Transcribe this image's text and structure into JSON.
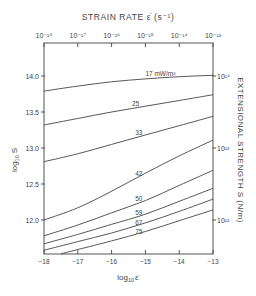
{
  "chart_data": {
    "type": "line",
    "title": "STRAIN RATE ε̇ (s⁻¹)",
    "xlabel": "log10 ε̇",
    "ylabel": "log10 S",
    "right_ylabel": "EXTENSIONAL STRENGTH S (N/m)",
    "top_xlabel": "STRAIN RATE ε̇ (s⁻¹)",
    "xlim": [
      -18,
      -13
    ],
    "ylim": [
      11.53,
      14.46
    ],
    "x_ticks": [
      -18,
      -17,
      -16,
      -15,
      -14,
      -13
    ],
    "x_tick_labels": [
      "−18",
      "−17",
      "−16",
      "−15",
      "−14",
      "−13"
    ],
    "top_x_tick_labels": [
      "10⁻¹⁸",
      "10⁻¹⁷",
      "10⁻¹⁶",
      "10⁻¹⁵",
      "10⁻¹⁴",
      "10⁻¹³"
    ],
    "y_ticks": [
      12.0,
      12.5,
      13.0,
      13.5,
      14.0
    ],
    "y_tick_labels": [
      "12.0",
      "12.5",
      "13.0",
      "13.5",
      "14.0"
    ],
    "right_y_ticks": [
      12,
      13,
      14
    ],
    "right_y_tick_labels": [
      "10¹²",
      "10¹³",
      "10¹⁴"
    ],
    "grid": false,
    "legend": "inline curve labels (heat flow)",
    "series": [
      {
        "name": "17 mW/m²",
        "label": "17 mW/m²",
        "x": [
          -18,
          -17,
          -16,
          -15,
          -14,
          -13
        ],
        "values": [
          13.79,
          13.86,
          13.92,
          13.96,
          13.99,
          14.01
        ]
      },
      {
        "name": "25",
        "label": "25",
        "x": [
          -18,
          -17,
          -16,
          -15,
          -14,
          -13
        ],
        "values": [
          13.32,
          13.41,
          13.5,
          13.58,
          13.66,
          13.74
        ]
      },
      {
        "name": "33",
        "label": "33",
        "x": [
          -18,
          -17,
          -16,
          -15,
          -14,
          -13
        ],
        "values": [
          12.81,
          12.92,
          13.05,
          13.18,
          13.31,
          13.44
        ]
      },
      {
        "name": "42",
        "label": "42",
        "x": [
          -18,
          -17,
          -16,
          -15,
          -14,
          -13
        ],
        "values": [
          12.0,
          12.17,
          12.4,
          12.65,
          12.89,
          13.11
        ]
      },
      {
        "name": "50",
        "label": "50",
        "x": [
          -18,
          -17,
          -16,
          -15,
          -14,
          -13
        ],
        "values": [
          11.78,
          11.93,
          12.1,
          12.27,
          12.48,
          12.69
        ]
      },
      {
        "name": "59",
        "label": "59",
        "x": [
          -18,
          -17,
          -16,
          -15,
          -14,
          -13
        ],
        "values": [
          11.67,
          11.8,
          11.94,
          12.08,
          12.26,
          12.44
        ]
      },
      {
        "name": "67",
        "label": "67",
        "x": [
          -18,
          -17,
          -16,
          -15,
          -14,
          -13
        ],
        "values": [
          11.58,
          11.7,
          11.82,
          11.96,
          12.12,
          12.29
        ]
      },
      {
        "name": "75",
        "label": "75",
        "x": [
          -17.5,
          -17,
          -16,
          -15,
          -14,
          -13
        ],
        "values": [
          11.53,
          11.59,
          11.71,
          11.84,
          11.99,
          12.14
        ]
      }
    ]
  },
  "labels": {
    "top_title": "STRAIN RATE",
    "top_title_symbol": "ε̇",
    "top_title_units": "(s⁻¹)",
    "bottom_axis": "log",
    "bottom_axis_sub": "10",
    "bottom_axis_symbol": "ε̇",
    "left_axis": "log",
    "left_axis_sub": "10",
    "left_axis_symbol": "S",
    "right_axis": "EXTENSIONAL STRENGTH  S  (N/m)"
  }
}
